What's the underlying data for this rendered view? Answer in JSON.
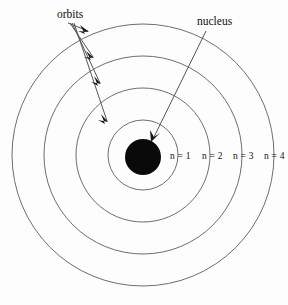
{
  "diagram": {
    "title_alt": "Bohr model of the atom",
    "background_color": "#fdfdfd",
    "orbit_stroke_color": "#6e6e6e",
    "nucleus_color": "#0a0a0a",
    "leader_color": "#555555",
    "callouts": {
      "orbits_label": "orbits",
      "nucleus_label": "nucleus"
    },
    "shell_labels": [
      {
        "text": "n = 1"
      },
      {
        "text": "n = 2"
      },
      {
        "text": "n = 3"
      },
      {
        "text": "n = 4"
      }
    ],
    "geometry": {
      "center_x": 143,
      "center_y": 155,
      "nucleus_radius": 18,
      "orbit_radii": [
        35,
        67,
        99,
        131
      ]
    }
  }
}
